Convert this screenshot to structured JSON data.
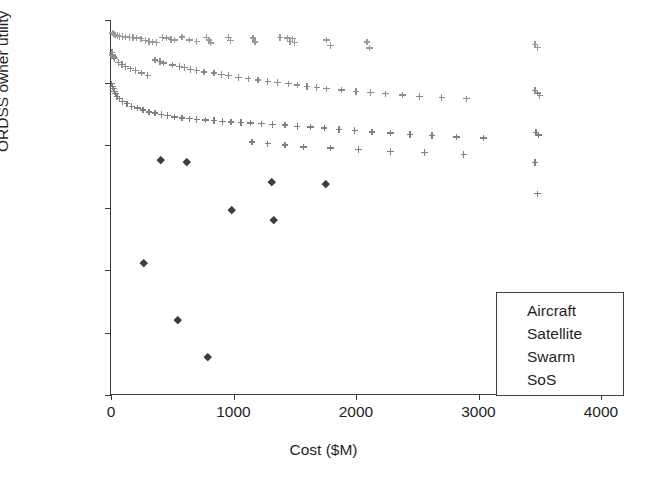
{
  "chart_data": {
    "type": "scatter",
    "title": "",
    "xlabel": "Cost ($M)",
    "ylabel": "ORDSS owner utility",
    "xlim": [
      0,
      4000
    ],
    "ylim": [
      0.994,
      1
    ],
    "xticks": [
      "0",
      "1000",
      "2000",
      "3000",
      "4000"
    ],
    "xtick_values": [
      0,
      1000,
      2000,
      3000,
      4000
    ],
    "yticks": [
      "0.994",
      "0.995",
      "0.996",
      "0.997",
      "0.998",
      "0.999",
      "1"
    ],
    "ytick_values": [
      0.994,
      0.995,
      0.996,
      0.997,
      0.998,
      0.999,
      1
    ],
    "grid": false,
    "legend_position": "lower right",
    "series": [
      {
        "name": "Aircraft",
        "marker": "plus",
        "color": "#9a9a9a",
        "points": [
          [
            10,
            0.99979
          ],
          [
            18,
            0.99978
          ],
          [
            26,
            0.99977
          ],
          [
            34,
            0.99976
          ],
          [
            55,
            0.99975
          ],
          [
            70,
            0.99974
          ],
          [
            95,
            0.99974
          ],
          [
            120,
            0.99973
          ],
          [
            150,
            0.99972
          ],
          [
            180,
            0.99972
          ],
          [
            210,
            0.99971
          ],
          [
            245,
            0.9997
          ],
          [
            280,
            0.99967
          ],
          [
            310,
            0.99966
          ],
          [
            340,
            0.99965
          ],
          [
            370,
            0.99964
          ],
          [
            420,
            0.99972
          ],
          [
            455,
            0.99971
          ],
          [
            490,
            0.99969
          ],
          [
            520,
            0.99968
          ],
          [
            580,
            0.99973
          ],
          [
            640,
            0.99968
          ],
          [
            700,
            0.99966
          ],
          [
            780,
            0.99972
          ],
          [
            800,
            0.99968
          ],
          [
            815,
            0.99963
          ],
          [
            960,
            0.99972
          ],
          [
            975,
            0.99967
          ],
          [
            1160,
            0.99971
          ],
          [
            1175,
            0.99965
          ],
          [
            1380,
            0.99972
          ],
          [
            1440,
            0.99971
          ],
          [
            1460,
            0.99966
          ],
          [
            1480,
            0.9997
          ],
          [
            1500,
            0.99964
          ],
          [
            1760,
            0.99968
          ],
          [
            1790,
            0.99959
          ],
          [
            2090,
            0.99965
          ],
          [
            2110,
            0.99955
          ],
          [
            3460,
            0.99961
          ],
          [
            3480,
            0.99956
          ]
        ]
      },
      {
        "name": "Satellite",
        "marker": "plus",
        "color": "#8c8c8c",
        "points": [
          [
            8,
            0.99948
          ],
          [
            14,
            0.99944
          ],
          [
            22,
            0.99941
          ],
          [
            30,
            0.99938
          ],
          [
            60,
            0.99932
          ],
          [
            90,
            0.99929
          ],
          [
            120,
            0.99926
          ],
          [
            160,
            0.99922
          ],
          [
            200,
            0.99919
          ],
          [
            250,
            0.99915
          ],
          [
            300,
            0.99911
          ],
          [
            360,
            0.99936
          ],
          [
            400,
            0.99934
          ],
          [
            430,
            0.99931
          ],
          [
            500,
            0.99928
          ],
          [
            560,
            0.99926
          ],
          [
            600,
            0.99924
          ],
          [
            650,
            0.99921
          ],
          [
            700,
            0.99919
          ],
          [
            760,
            0.99917
          ],
          [
            840,
            0.99915
          ],
          [
            900,
            0.99913
          ],
          [
            960,
            0.99911
          ],
          [
            1040,
            0.99908
          ],
          [
            1120,
            0.99906
          ],
          [
            1200,
            0.99904
          ],
          [
            1280,
            0.99902
          ],
          [
            1360,
            0.999
          ],
          [
            1450,
            0.99898
          ],
          [
            1520,
            0.99896
          ],
          [
            1600,
            0.99894
          ],
          [
            1680,
            0.99892
          ],
          [
            1760,
            0.9989
          ],
          [
            1880,
            0.99888
          ],
          [
            2000,
            0.99886
          ],
          [
            2120,
            0.99884
          ],
          [
            2240,
            0.99882
          ],
          [
            2380,
            0.9988
          ],
          [
            2520,
            0.99878
          ],
          [
            2700,
            0.99876
          ],
          [
            2900,
            0.99874
          ],
          [
            3460,
            0.99887
          ],
          [
            3480,
            0.99883
          ],
          [
            3500,
            0.99879
          ]
        ]
      },
      {
        "name": "Swarm",
        "marker": "diamond",
        "color": "#3d3d3d",
        "points": [
          [
            270,
            0.99612
          ],
          [
            410,
            0.99776
          ],
          [
            545,
            0.9952
          ],
          [
            615,
            0.99773
          ],
          [
            790,
            0.99462
          ],
          [
            985,
            0.99697
          ],
          [
            1310,
            0.99741
          ],
          [
            1330,
            0.9968
          ],
          [
            1755,
            0.99738
          ]
        ]
      },
      {
        "name": "SoS",
        "marker": "plus",
        "color": "#7f7f7f",
        "points": [
          [
            6,
            0.99898
          ],
          [
            12,
            0.99894
          ],
          [
            20,
            0.9989
          ],
          [
            28,
            0.99886
          ],
          [
            36,
            0.99882
          ],
          [
            50,
            0.99878
          ],
          [
            70,
            0.99874
          ],
          [
            95,
            0.9987
          ],
          [
            130,
            0.99866
          ],
          [
            170,
            0.99862
          ],
          [
            215,
            0.99859
          ],
          [
            260,
            0.99856
          ],
          [
            310,
            0.99853
          ],
          [
            360,
            0.99851
          ],
          [
            410,
            0.99849
          ],
          [
            460,
            0.99847
          ],
          [
            520,
            0.99845
          ],
          [
            580,
            0.99843
          ],
          [
            640,
            0.99842
          ],
          [
            700,
            0.99841
          ],
          [
            770,
            0.9984
          ],
          [
            840,
            0.99839
          ],
          [
            910,
            0.99838
          ],
          [
            980,
            0.99837
          ],
          [
            1060,
            0.99836
          ],
          [
            1140,
            0.99835
          ],
          [
            1230,
            0.99834
          ],
          [
            1320,
            0.99833
          ],
          [
            1420,
            0.99832
          ],
          [
            1520,
            0.9983
          ],
          [
            1630,
            0.99829
          ],
          [
            1740,
            0.99827
          ],
          [
            1860,
            0.99825
          ],
          [
            1990,
            0.99823
          ],
          [
            2130,
            0.99821
          ],
          [
            2280,
            0.99819
          ],
          [
            2440,
            0.99817
          ],
          [
            2620,
            0.99815
          ],
          [
            2820,
            0.99813
          ],
          [
            3040,
            0.99811
          ],
          [
            1150,
            0.99805
          ],
          [
            1280,
            0.99802
          ],
          [
            1420,
            0.998
          ],
          [
            1570,
            0.99797
          ],
          [
            1790,
            0.99795
          ],
          [
            2020,
            0.99793
          ],
          [
            2280,
            0.9979
          ],
          [
            2560,
            0.99788
          ],
          [
            2880,
            0.99785
          ],
          [
            3470,
            0.9982
          ],
          [
            3490,
            0.99816
          ],
          [
            3460,
            0.99772
          ],
          [
            3480,
            0.99722
          ]
        ]
      }
    ]
  },
  "legend": {
    "items": [
      {
        "label": "Aircraft",
        "marker": "plus",
        "color": "#9a9a9a"
      },
      {
        "label": "Satellite",
        "marker": "plus",
        "color": "#8c8c8c"
      },
      {
        "label": "Swarm",
        "marker": "diamond",
        "color": "#3d3d3d"
      },
      {
        "label": "SoS",
        "marker": "plus",
        "color": "#7f7f7f"
      }
    ]
  }
}
